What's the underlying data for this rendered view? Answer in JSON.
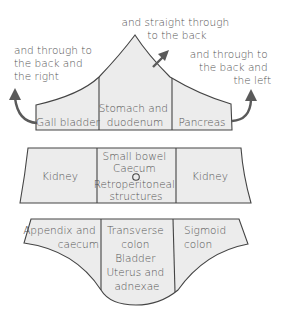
{
  "colors": {
    "fill": "#ececec",
    "stroke": "#444444",
    "text": "#555555",
    "arrow": "#5a5a5a"
  },
  "annotations": {
    "left": [
      "and through to",
      "the back and",
      "the right"
    ],
    "top": [
      "and straight through",
      "to the back"
    ],
    "right": [
      "and through to",
      "the back and",
      "the left"
    ]
  },
  "upper": {
    "left": [
      "Gall bladder"
    ],
    "center": [
      "Stomach and",
      "duodenum"
    ],
    "right": [
      "Pancreas"
    ]
  },
  "middle": {
    "left": [
      "Kidney"
    ],
    "center": [
      "Small bowel",
      "Caecum",
      "Retroperitoneal",
      "structures"
    ],
    "center_marker": "umbilicus-circle",
    "right": [
      "Kidney"
    ]
  },
  "lower": {
    "left": [
      "Appendix and",
      "caecum"
    ],
    "center": [
      "Transverse",
      "colon",
      "Bladder",
      "Uterus and",
      "adnexae"
    ],
    "right": [
      "Sigmoid",
      "colon"
    ]
  }
}
